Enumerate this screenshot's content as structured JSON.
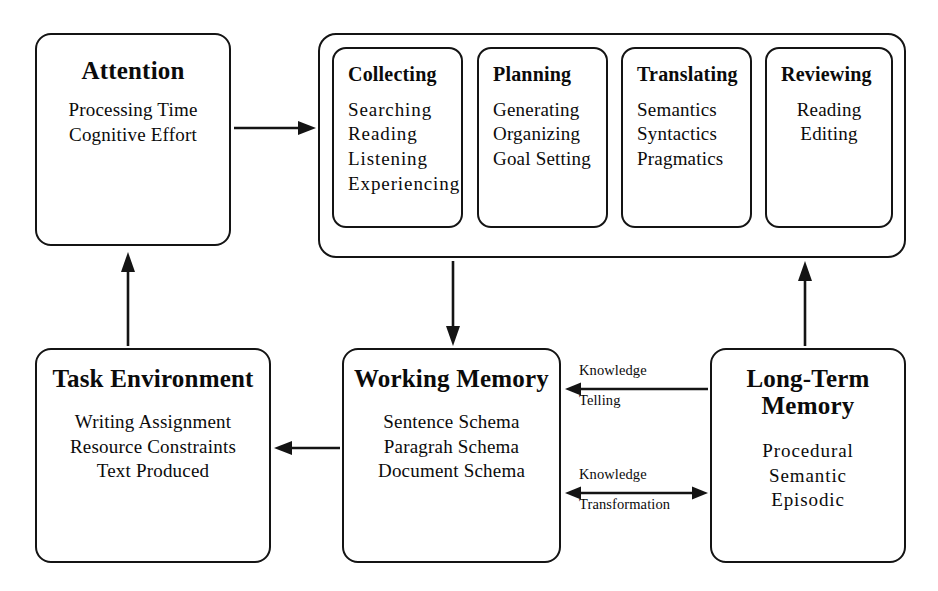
{
  "diagram": {
    "stroke_color": "#141414",
    "background_color": "#ffffff"
  },
  "attention_box": {
    "title": "Attention",
    "items": [
      "Processing Time",
      "Cognitive Effort"
    ]
  },
  "process_group": {
    "boxes": [
      {
        "title": "Collecting",
        "items": [
          "Searching",
          "Reading",
          "Listening",
          "Experiencing"
        ]
      },
      {
        "title": "Planning",
        "items": [
          "Generating",
          "Organizing",
          "Goal Setting"
        ]
      },
      {
        "title": "Translating",
        "items": [
          "Semantics",
          "Syntactics",
          "Pragmatics"
        ]
      },
      {
        "title": "Reviewing",
        "items": [
          "Reading",
          "Editing"
        ]
      }
    ]
  },
  "task_environment_box": {
    "title_line1": "Task",
    "title_line2": "Environment",
    "items": [
      "Writing Assignment",
      "Resource Constraints",
      "Text Produced"
    ]
  },
  "working_memory_box": {
    "title_line1": "Working",
    "title_line2": "Memory",
    "items": [
      "Sentence Schema",
      "Paragrah Schema",
      "Document Schema"
    ]
  },
  "long_term_memory_box": {
    "title_line1": "Long-Term",
    "title_line2": "Memory",
    "items": [
      "Procedural",
      "Semantic",
      "Episodic"
    ]
  },
  "arrows": {
    "attention_to_process": {
      "icon": "arrow-right-icon",
      "label": ""
    },
    "task_env_to_attention": {
      "icon": "arrow-up-icon",
      "label": ""
    },
    "process_to_working_memory": {
      "icon": "arrow-down-icon",
      "label": ""
    },
    "long_term_to_reviewing": {
      "icon": "arrow-up-icon",
      "label": ""
    },
    "working_memory_to_task_env": {
      "icon": "arrow-left-icon",
      "label": ""
    },
    "knowledge_telling": {
      "icon": "arrow-left-icon",
      "label_top": "Knowledge",
      "label_bottom": "Telling"
    },
    "knowledge_transformation": {
      "icon": "arrow-both-icon",
      "label_top": "Knowledge",
      "label_bottom": "Transformation"
    }
  }
}
